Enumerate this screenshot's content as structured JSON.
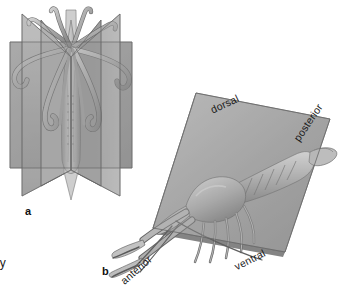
{
  "figure": {
    "background_color": "#ffffff",
    "ink_color": "#1a1a1a",
    "plane_fill_light": "#b4b4b4",
    "plane_fill_mid": "#9a9a9a",
    "plane_fill_dark": "#7d7d7d",
    "plane_edge": "#5f5f5f",
    "animal_light": "#d3d3d3",
    "animal_mid": "#a8a8a8",
    "animal_dark": "#6e6e6e"
  },
  "panels": [
    {
      "id": "a",
      "letter": "a",
      "organism": "squid",
      "symmetry": "radial",
      "plane_count": 4,
      "axis_labels": []
    },
    {
      "id": "b",
      "letter": "b",
      "organism": "crayfish",
      "symmetry": "bilateral",
      "plane_count": 1,
      "axis_labels": [
        {
          "key": "dorsal",
          "text": "dorsal"
        },
        {
          "key": "posterior",
          "text": "posterior"
        },
        {
          "key": "ventral",
          "text": "ventral"
        },
        {
          "key": "anterior",
          "text": "anterior"
        }
      ]
    }
  ],
  "cropped_caption_fragment": "ly"
}
